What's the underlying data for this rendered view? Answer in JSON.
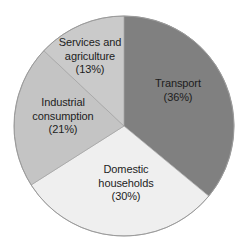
{
  "chart_data": {
    "type": "pie",
    "title": "",
    "subtitle": "",
    "xlabel": "",
    "ylabel": "",
    "legend_position": "none",
    "grid": false,
    "labels_inside_slices": true,
    "start_angle_deg": 0,
    "direction": "clockwise",
    "categories": [
      "Transport",
      "Domestic households",
      "Industrial consumption",
      "Services and agriculture"
    ],
    "values": [
      36,
      30,
      21,
      13
    ],
    "value_unit": "%",
    "slices": [
      {
        "name": "Transport",
        "value": 36,
        "value_text": "(36%)",
        "label_line1": "Transport",
        "label_line2": "",
        "color": "#808080",
        "start_deg": 0,
        "end_deg": 129.6
      },
      {
        "name": "Domestic households",
        "value": 30,
        "value_text": "(30%)",
        "label_line1": "Domestic",
        "label_line2": "households",
        "color": "#efefef",
        "start_deg": 129.6,
        "end_deg": 237.6
      },
      {
        "name": "Industrial consumption",
        "value": 21,
        "value_text": "(21%)",
        "label_line1": "Industrial",
        "label_line2": "consumption",
        "color": "#c4c4c4",
        "start_deg": 237.6,
        "end_deg": 313.2
      },
      {
        "name": "Services and agriculture",
        "value": 13,
        "value_text": "(13%)",
        "label_line1": "Services and",
        "label_line2": "agriculture",
        "color": "#cacaca",
        "start_deg": 313.2,
        "end_deg": 360
      }
    ],
    "geometry": {
      "center_x": 124,
      "center_y": 126,
      "radius": 110
    },
    "colors": {
      "transport": "#808080",
      "domestic_households": "#efefef",
      "industrial_consumption": "#c4c4c4",
      "services_and_agriculture": "#cacaca",
      "outline": "#9a9a9a",
      "text": "#1d1d1d",
      "background": "#ffffff"
    }
  }
}
